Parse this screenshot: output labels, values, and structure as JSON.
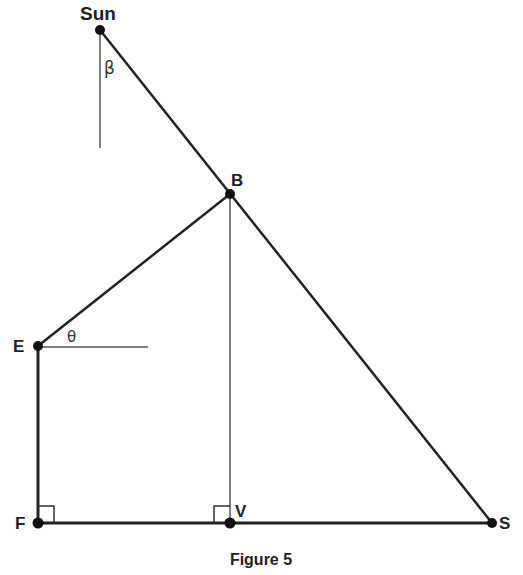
{
  "figure": {
    "caption": "Figure 5",
    "colors": {
      "line": "#222222",
      "thin_line": "#555555",
      "point": "#111111",
      "background": "#ffffff"
    },
    "points": {
      "sun": {
        "label": "Sun",
        "x": 100,
        "y": 30
      },
      "b": {
        "label": "B",
        "x": 230,
        "y": 194
      },
      "e": {
        "label": "E",
        "x": 38,
        "y": 346
      },
      "f": {
        "label": "F",
        "x": 38,
        "y": 523
      },
      "v": {
        "label": "V",
        "x": 230,
        "y": 523
      },
      "s": {
        "label": "S",
        "x": 492,
        "y": 523
      }
    },
    "angles": {
      "beta": {
        "label": "β"
      },
      "theta": {
        "label": "θ"
      }
    },
    "right_angle_marks": [
      "F",
      "V"
    ]
  }
}
